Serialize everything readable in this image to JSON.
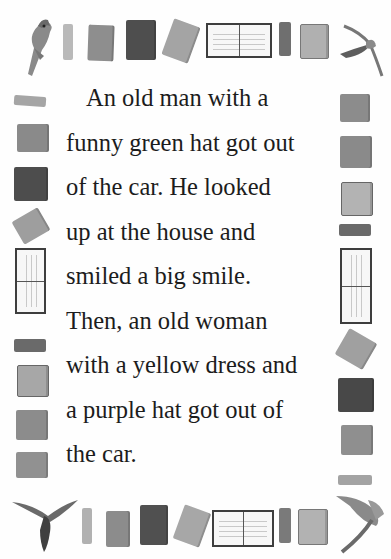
{
  "story": {
    "lines": [
      "An old man with a",
      "funny green hat got out",
      "of the car. He looked",
      "up at the house and",
      "smiled a big smile.",
      "Then, an old woman",
      "with a yellow dress and",
      "a purple hat got out of",
      "the car."
    ]
  },
  "frame": {
    "style": "watercolor border of books and birds",
    "colors": {
      "book_dark": "#4a4a4a",
      "book_mid": "#7d7d7d",
      "book_light": "#a9a9a9",
      "book_pale": "#c4c4c4",
      "text": "#1c1c1c"
    },
    "icons": [
      "parrot-icon",
      "bird-flying-icon",
      "book-icon",
      "open-book-icon",
      "book-spine-icon"
    ]
  }
}
